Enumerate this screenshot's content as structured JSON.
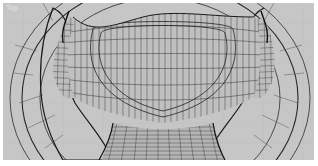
{
  "viewport": {
    "label": "Top",
    "background": "#c6c6c6",
    "grid_color": "#bdbdbd",
    "wire_color": "#1e1e1e",
    "object": "steering-wheel-wireframe-mesh"
  }
}
